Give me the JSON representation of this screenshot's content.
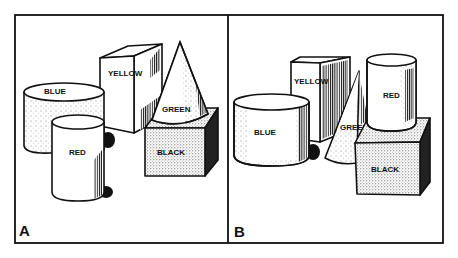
{
  "figure": {
    "panels": [
      {
        "id": "A",
        "label": "A",
        "objects": [
          {
            "shape": "cylinder",
            "label": "BLUE"
          },
          {
            "shape": "cylinder",
            "label": "RED"
          },
          {
            "shape": "cube",
            "label": "YELLOW"
          },
          {
            "shape": "cone",
            "label": "GREEN"
          },
          {
            "shape": "cube",
            "label": "BLACK"
          }
        ]
      },
      {
        "id": "B",
        "label": "B",
        "objects": [
          {
            "shape": "cylinder",
            "label": "BLUE"
          },
          {
            "shape": "cube",
            "label": "YELLOW"
          },
          {
            "shape": "cone",
            "label": "GREEN"
          },
          {
            "shape": "cylinder",
            "label": "RED"
          },
          {
            "shape": "cube",
            "label": "BLACK"
          }
        ]
      }
    ],
    "colors": {
      "ink": "#111111",
      "background": "#ffffff"
    }
  }
}
